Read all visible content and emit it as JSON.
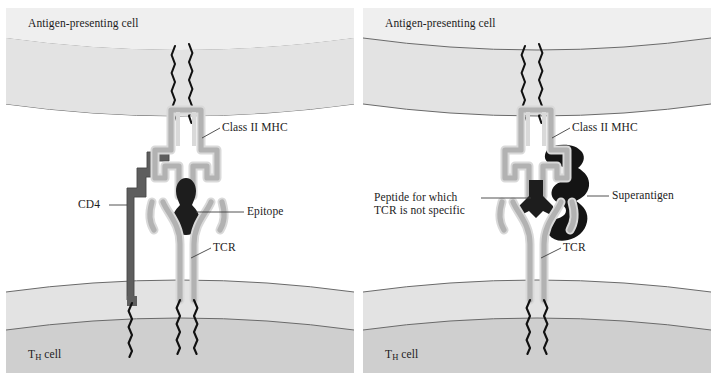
{
  "figure": {
    "panel_count": 2
  },
  "colors": {
    "cell_fill_upper": "#ededed",
    "cell_fill_band": "#e4e4e4",
    "cell_fill_lower": "#cfcfcf",
    "membrane_line": "#5a5a5a",
    "mhc_fill": "#b5b5b5",
    "mhc_outline": "#dcdcdc",
    "tcr_fill": "#b5b5b5",
    "cd4_fill": "#5e5e5e",
    "epitope_fill": "#1d1d1d",
    "superantigen_fill": "#141414",
    "peptide_fill": "#1d1d1d",
    "text": "#1c1c1c",
    "leader_line": "#4a4a4a",
    "background": "#ffffff"
  },
  "left_panel": {
    "name": "conventional-antigen-presentation",
    "labels": {
      "apc": "Antigen-presenting cell",
      "mhc": "Class II MHC",
      "cd4": "CD4",
      "epitope": "Epitope",
      "tcr": "TCR",
      "th_cell_prefix": "T",
      "th_cell_subscript": "H",
      "th_cell_suffix": " cell"
    }
  },
  "right_panel": {
    "name": "superantigen-presentation",
    "labels": {
      "apc": "Antigen-presenting cell",
      "mhc": "Class II MHC",
      "peptide_line1": "Peptide for which",
      "peptide_line2": "TCR is not specific",
      "superantigen": "Superantigen",
      "tcr": "TCR",
      "th_cell_prefix": "T",
      "th_cell_subscript": "H",
      "th_cell_suffix": " cell"
    }
  }
}
